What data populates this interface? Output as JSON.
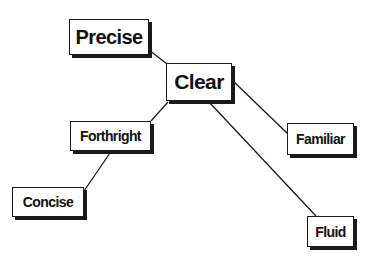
{
  "diagram": {
    "type": "concept-tree",
    "nodes": [
      {
        "id": "precise",
        "label": "Precise"
      },
      {
        "id": "clear",
        "label": "Clear"
      },
      {
        "id": "forthright",
        "label": "Forthright"
      },
      {
        "id": "concise",
        "label": "Concise"
      },
      {
        "id": "familiar",
        "label": "Familiar"
      },
      {
        "id": "fluid",
        "label": "Fluid"
      }
    ],
    "edges": [
      {
        "from": "precise",
        "to": "clear"
      },
      {
        "from": "clear",
        "to": "forthright"
      },
      {
        "from": "clear",
        "to": "familiar"
      },
      {
        "from": "clear",
        "to": "fluid"
      },
      {
        "from": "forthright",
        "to": "concise"
      }
    ],
    "colors": {
      "stroke": "#1a1a1a",
      "fill": "#ffffff",
      "text": "#111111"
    }
  }
}
